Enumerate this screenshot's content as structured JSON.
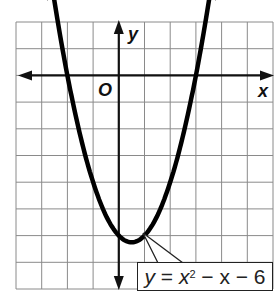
{
  "chart_data": {
    "type": "line",
    "title": "",
    "xlabel": "x",
    "ylabel": "y",
    "origin_label": "O",
    "function": "y = x^2 - x - 6",
    "xlim": [
      -4,
      6
    ],
    "ylim": [
      -8,
      2
    ],
    "grid": true,
    "grid_step": 1,
    "tick_labels": false,
    "series": [
      {
        "name": "y = x² − x − 6",
        "x": [
          -2.6,
          -2,
          -1,
          0,
          0.5,
          1,
          2,
          3,
          3.6
        ],
        "y": [
          2.36,
          0,
          -4,
          -6,
          -6.25,
          -6,
          -4,
          0,
          2.36
        ]
      }
    ],
    "key_points": {
      "vertex": [
        0.5,
        -6.25
      ],
      "x_intercepts": [
        -2,
        3
      ],
      "y_intercept": -6
    },
    "annotation": {
      "text_y": "y",
      "text_eq": "=",
      "text_x": "x",
      "exp": "2",
      "text_rest": "− x − 6"
    },
    "colors": {
      "curve": "#000000",
      "grid": "#7a7a7a",
      "axis": "#111111"
    }
  }
}
